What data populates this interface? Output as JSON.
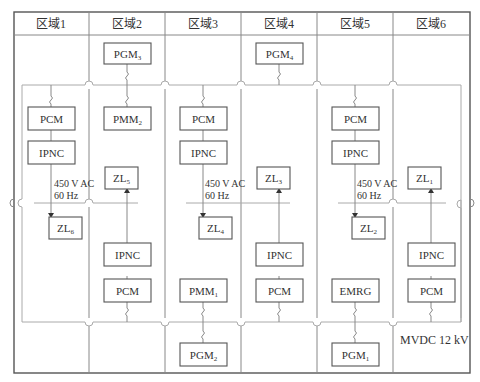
{
  "headers": [
    "区域1",
    "区域2",
    "区域3",
    "区域4",
    "区域5",
    "区域6"
  ],
  "boxes": {
    "pgm3": {
      "base": "PGM",
      "sub": "3"
    },
    "pgm4": {
      "base": "PGM",
      "sub": "4"
    },
    "pcm_z1": {
      "base": "PCM"
    },
    "pmm2": {
      "base": "PMM",
      "sub": "2"
    },
    "pcm_z3": {
      "base": "PCM"
    },
    "pcm_z5": {
      "base": "PCM"
    },
    "ipnc_z1": {
      "base": "IPNC"
    },
    "ipnc_z3": {
      "base": "IPNC"
    },
    "ipnc_z5": {
      "base": "IPNC"
    },
    "zl5": {
      "base": "ZL",
      "sub": "5"
    },
    "zl3": {
      "base": "ZL",
      "sub": "3"
    },
    "zl1": {
      "base": "ZL",
      "sub": "1"
    },
    "zl6": {
      "base": "ZL",
      "sub": "6"
    },
    "zl4": {
      "base": "ZL",
      "sub": "4"
    },
    "zl2": {
      "base": "ZL",
      "sub": "2"
    },
    "ipnc_z2": {
      "base": "IPNC"
    },
    "ipnc_z4": {
      "base": "IPNC"
    },
    "ipnc_z6": {
      "base": "IPNC"
    },
    "pcm_z2": {
      "base": "PCM"
    },
    "pcm_z4": {
      "base": "PCM"
    },
    "pcm_z6": {
      "base": "PCM"
    },
    "pmm1": {
      "base": "PMM",
      "sub": "1"
    },
    "emrg": {
      "base": "EMRG"
    },
    "pgm2": {
      "base": "PGM",
      "sub": "2"
    },
    "pgm1": {
      "base": "PGM",
      "sub": "1"
    }
  },
  "ac_bus_label": {
    "line1": "450 V AC",
    "line2": "60 Hz"
  },
  "mvdc_label": "MVDC 12 kV",
  "colors": {
    "border": "#555555",
    "bus": "#aaaaaa",
    "text": "#333333"
  }
}
